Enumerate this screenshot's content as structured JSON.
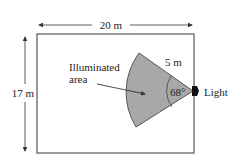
{
  "diagram": {
    "width_label": "20 m",
    "height_label": "17 m",
    "radius_label": "5 m",
    "angle_label": "68°",
    "area_label_line1": "Illuminated",
    "area_label_line2": "area",
    "light_label": "Light",
    "room_width_m": 20,
    "room_height_m": 17,
    "sector_radius_m": 5,
    "sector_angle_deg": 68,
    "colors": {
      "sector_fill": "#a8a8a8",
      "outline": "#444444",
      "text": "#222222",
      "light": "#111111"
    }
  }
}
